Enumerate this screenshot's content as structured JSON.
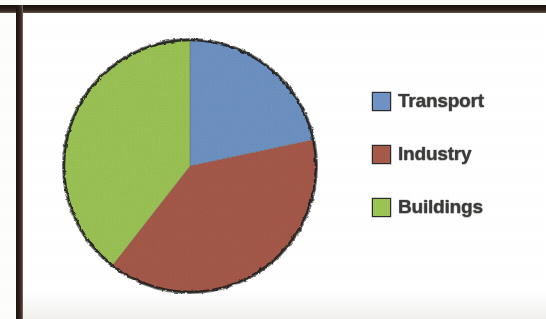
{
  "chart_data": {
    "type": "pie",
    "title": "",
    "categories": [
      "Transport",
      "Industry",
      "Buildings"
    ],
    "values": [
      22,
      39,
      39
    ],
    "units": "percent",
    "colors": [
      "#6E93C4",
      "#A65A4A",
      "#9CC455"
    ],
    "legend_position": "right",
    "grid": false,
    "start_angle_deg": 0,
    "direction": "clockwise",
    "slice_angles_deg": [
      78,
      140,
      142
    ],
    "labels_on_slices": false
  },
  "legend": {
    "items": [
      {
        "label": "Transport",
        "color": "#6E93C4"
      },
      {
        "label": "Industry",
        "color": "#A65A4A"
      },
      {
        "label": "Buildings",
        "color": "#9CC455"
      }
    ]
  },
  "pie": {
    "outline_color": "#1d1d1d",
    "slices": [
      {
        "name": "Transport",
        "color": "#6E93C4",
        "start": 0,
        "end": 78
      },
      {
        "name": "Industry",
        "color": "#A65A4A",
        "start": 78,
        "end": 218
      },
      {
        "name": "Buildings",
        "color": "#9CC455",
        "start": 218,
        "end": 360
      }
    ]
  },
  "frame": {
    "border_color": "#221813",
    "background": "#ffffff"
  }
}
